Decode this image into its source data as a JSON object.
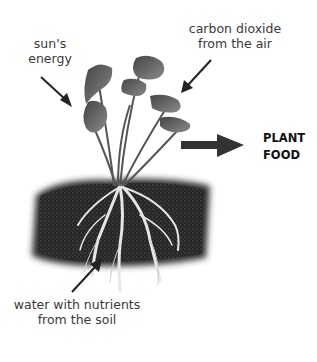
{
  "diagram": {
    "labels": {
      "sun": [
        "sun's",
        "energy"
      ],
      "co2": [
        "carbon dioxide",
        "from the air"
      ],
      "water": [
        "water with nutrients",
        "from the soil"
      ],
      "output": [
        "PLANT",
        "FOOD"
      ]
    },
    "colors": {
      "text": "#3a3a3a",
      "arrow": "#222222",
      "big_arrow": "#333333",
      "leaf": "#5a5a5a",
      "soil": "#1e1e1e",
      "root": "#e8e8e8"
    }
  }
}
